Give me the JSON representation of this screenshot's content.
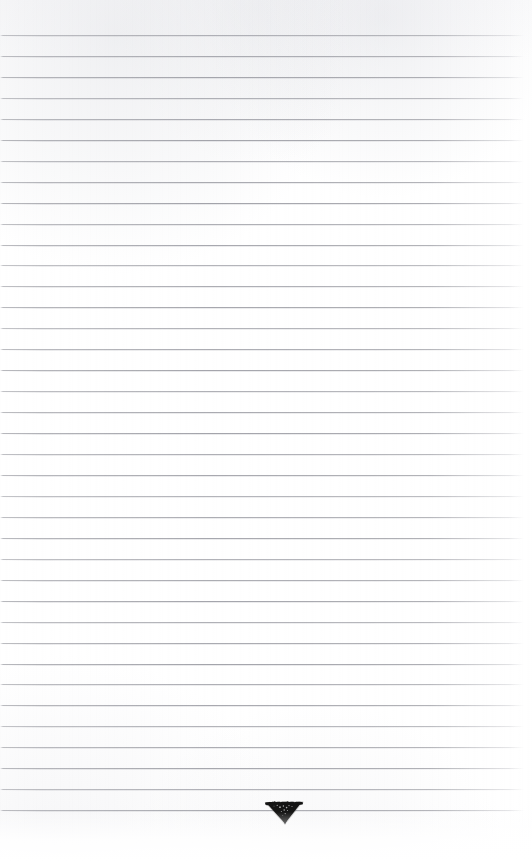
{
  "page": {
    "kind": "ruled-notebook-page",
    "width": 532,
    "height": 862,
    "background_color": "#ffffff",
    "text_content": "",
    "has_handwriting": false
  },
  "ruling": {
    "line_color": "#92939b",
    "line_count": 38,
    "first_line_y": 35,
    "line_spacing": 20.95,
    "line_thickness": 1,
    "line_left_x": 0,
    "line_right_x": 524,
    "orientation": "horizontal"
  },
  "margins": {
    "top_margin_height": 35,
    "bottom_margin_height": 52,
    "left_margin_width": 0,
    "right_margin_width": 8
  },
  "ink_mark": {
    "label": "ink-blot-triangle",
    "shape": "inverted-triangle",
    "color": "#1a1a1a",
    "center_x": 284,
    "center_y": 810,
    "width": 36,
    "height": 21,
    "on_line_index": 37
  }
}
